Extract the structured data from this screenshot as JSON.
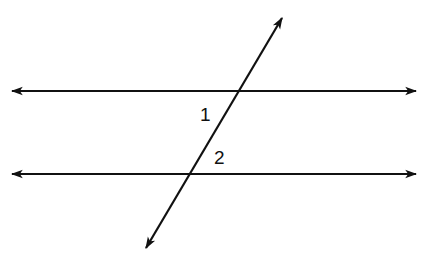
{
  "diagram": {
    "line_color": "#111111",
    "background": "#ffffff",
    "lines": [
      {
        "name": "parallel-line-top",
        "x1": 12,
        "y1": 91,
        "x2": 416,
        "y2": 91,
        "arrows": "both"
      },
      {
        "name": "parallel-line-bottom",
        "x1": 12,
        "y1": 174,
        "x2": 416,
        "y2": 174,
        "arrows": "both"
      },
      {
        "name": "transversal",
        "x1": 146,
        "y1": 248,
        "x2": 282,
        "y2": 18,
        "arrows": "both"
      }
    ],
    "angle_labels": [
      {
        "text": "1",
        "x": 200,
        "y": 121
      },
      {
        "text": "2",
        "x": 214,
        "y": 164
      }
    ]
  }
}
